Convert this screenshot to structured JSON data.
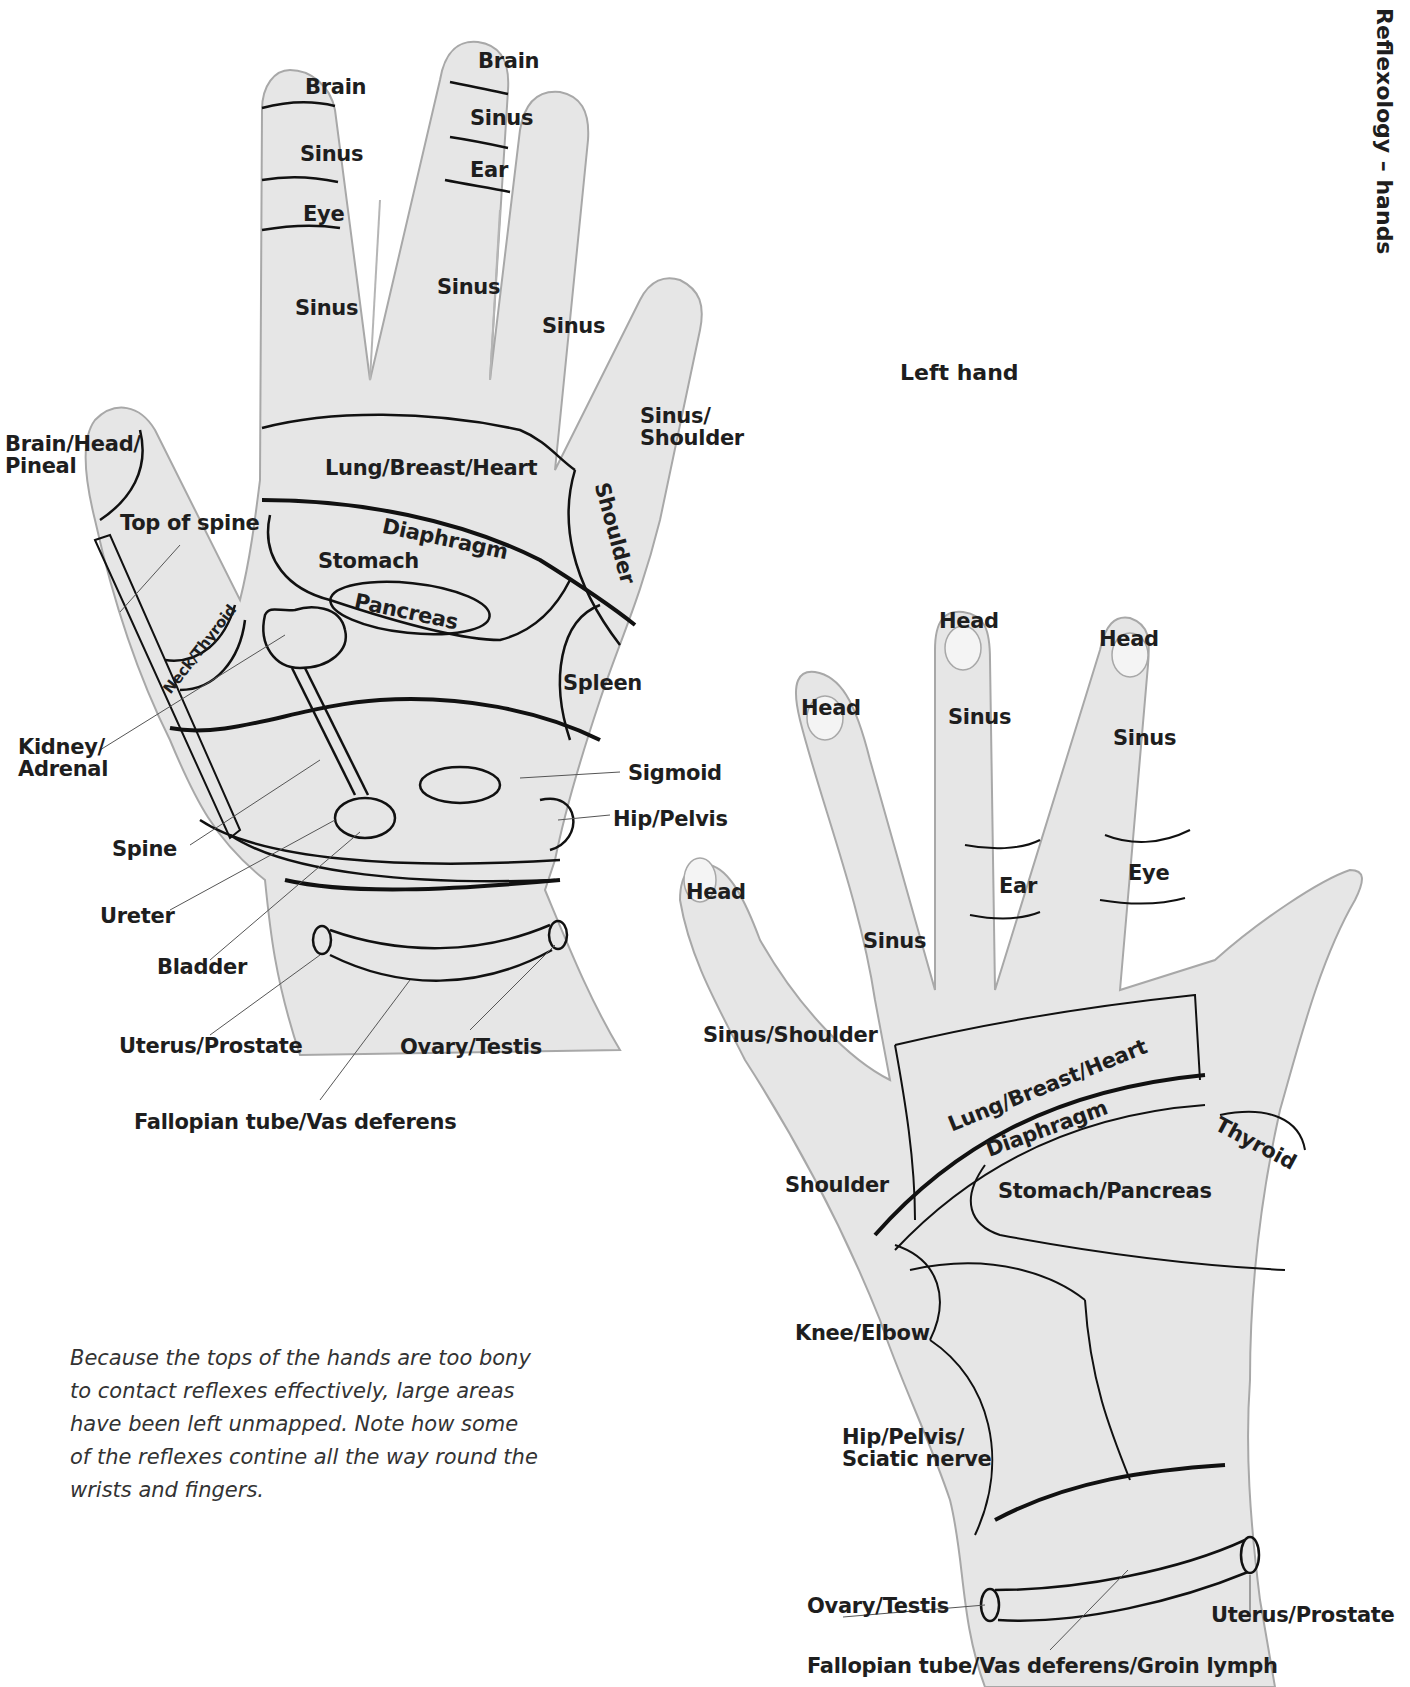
{
  "page": {
    "side_title": "Reflexology – hands",
    "hand_title": "Left hand",
    "caption": "Because the tops of the hands are too bony to contact reflexes effectively, large areas have been left unmapped. Note how some of the reflexes contine all the way round the wrists and fingers.",
    "colors": {
      "skin": "#e4e4e4",
      "outline": "#a8a8a8",
      "zone_line": "#111111",
      "text": "#1e1e1e"
    }
  },
  "back_hand": {
    "labels": {
      "brain_index": "Brain",
      "sinus_index_top": "Sinus",
      "eye": "Eye",
      "sinus_index": "Sinus",
      "brain_middle": "Brain",
      "sinus_middle_top": "Sinus",
      "ear": "Ear",
      "sinus_middle": "Sinus",
      "sinus_ring": "Sinus",
      "sinus_shoulder": "Sinus/\nShoulder",
      "brain_head_pineal": "Brain/Head/\nPineal",
      "top_of_spine": "Top of spine",
      "lung_breast_heart": "Lung/Breast/Heart",
      "diaphragm": "Diaphragm",
      "stomach": "Stomach",
      "pancreas": "Pancreas",
      "shoulder": "Shoulder",
      "neck_thyroid": "Neck/Thyroid",
      "spleen": "Spleen",
      "kidney_adrenal": "Kidney/\nAdrenal",
      "sigmoid": "Sigmoid",
      "hip_pelvis": "Hip/Pelvis",
      "spine": "Spine",
      "ureter": "Ureter",
      "bladder": "Bladder",
      "uterus_prostate": "Uterus/Prostate",
      "ovary_testis": "Ovary/Testis",
      "fallopian": "Fallopian tube/Vas deferens"
    }
  },
  "front_hand": {
    "labels": {
      "head_pinky": "Head",
      "head_ring": "Head",
      "head_middle": "Head",
      "head_index": "Head",
      "sinus_middle": "Sinus",
      "sinus_index": "Sinus",
      "sinus_ring": "Sinus",
      "ear": "Ear",
      "eye": "Eye",
      "sinus_shoulder": "Sinus/Shoulder",
      "lung_breast_heart": "Lung/Breast/Heart",
      "diaphragm": "Diaphragm",
      "thyroid": "Thyroid",
      "shoulder": "Shoulder",
      "stomach_pancreas": "Stomach/Pancreas",
      "knee_elbow": "Knee/Elbow",
      "hip_pelvis_sciatic": "Hip/Pelvis/\nSciatic nerve",
      "ovary_testis": "Ovary/Testis",
      "uterus_prostate": "Uterus/Prostate",
      "fallopian": "Fallopian tube/Vas deferens/Groin lymph"
    }
  }
}
